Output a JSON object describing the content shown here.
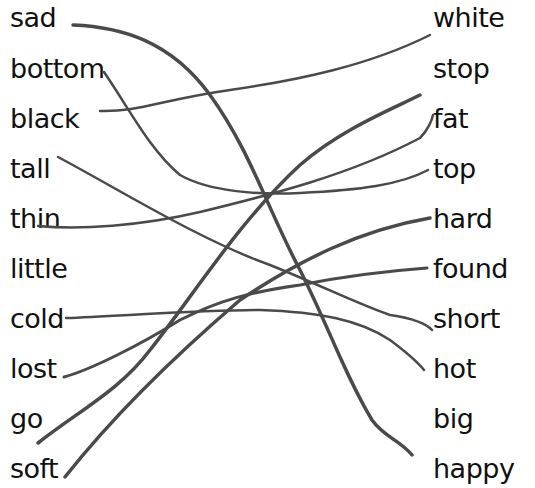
{
  "worksheet": {
    "left_words": [
      {
        "label": "sad",
        "x": 10,
        "y": 4
      },
      {
        "label": "bottom",
        "x": 10,
        "y": 55
      },
      {
        "label": "black",
        "x": 10,
        "y": 105
      },
      {
        "label": "tall",
        "x": 10,
        "y": 155
      },
      {
        "label": "thin",
        "x": 10,
        "y": 205
      },
      {
        "label": "little",
        "x": 10,
        "y": 255
      },
      {
        "label": "cold",
        "x": 10,
        "y": 305
      },
      {
        "label": "lost",
        "x": 10,
        "y": 355
      },
      {
        "label": "go",
        "x": 10,
        "y": 405
      },
      {
        "label": "soft",
        "x": 10,
        "y": 455
      }
    ],
    "right_words": [
      {
        "label": "white",
        "x": 433,
        "y": 4
      },
      {
        "label": "stop",
        "x": 433,
        "y": 55
      },
      {
        "label": "fat",
        "x": 433,
        "y": 105
      },
      {
        "label": "top",
        "x": 433,
        "y": 155
      },
      {
        "label": "hard",
        "x": 433,
        "y": 205
      },
      {
        "label": "found",
        "x": 433,
        "y": 255
      },
      {
        "label": "short",
        "x": 433,
        "y": 305
      },
      {
        "label": "hot",
        "x": 433,
        "y": 355
      },
      {
        "label": "big",
        "x": 433,
        "y": 405
      },
      {
        "label": "happy",
        "x": 433,
        "y": 455
      }
    ],
    "matches": [
      {
        "from": "sad",
        "to": "happy"
      },
      {
        "from": "bottom",
        "to": "top"
      },
      {
        "from": "black",
        "to": "white"
      },
      {
        "from": "tall",
        "to": "short"
      },
      {
        "from": "thin",
        "to": "fat"
      },
      {
        "from": "cold",
        "to": "hot"
      },
      {
        "from": "lost",
        "to": "found"
      },
      {
        "from": "go",
        "to": "stop"
      },
      {
        "from": "soft",
        "to": "hard"
      }
    ],
    "line_color": "#4a4a4a"
  }
}
